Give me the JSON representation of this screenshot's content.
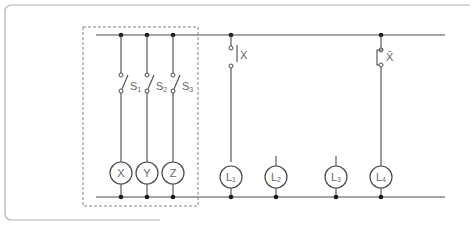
{
  "diagram": {
    "type": "relay-ladder-circuit",
    "colors": {
      "wire": "#4a4a4a",
      "node": "#1a1a1a",
      "label": "#666666",
      "frame": "#b0b0b0",
      "dashed_box": "#777777"
    },
    "dashed_group": {
      "description": "relay control section"
    },
    "switches": [
      {
        "id": "S1",
        "label": "S",
        "sub": "1",
        "type": "normally-open switch"
      },
      {
        "id": "S2",
        "label": "S",
        "sub": "2",
        "type": "normally-open switch"
      },
      {
        "id": "S3",
        "label": "S",
        "sub": "3",
        "type": "normally-open switch"
      }
    ],
    "relay_coils": [
      {
        "id": "X",
        "label": "X"
      },
      {
        "id": "Y",
        "label": "Y"
      },
      {
        "id": "Z",
        "label": "Z"
      }
    ],
    "contacts": [
      {
        "id": "X-NO",
        "label": "X",
        "type": "normally-open contact",
        "drives": "L1"
      },
      {
        "id": "X-NC",
        "label": "X̄",
        "type": "normally-closed contact",
        "drives": "L4"
      }
    ],
    "lamps": [
      {
        "id": "L1",
        "label": "L",
        "sub": "1",
        "connected": true
      },
      {
        "id": "L2",
        "label": "L",
        "sub": "2",
        "connected": false
      },
      {
        "id": "L3",
        "label": "L",
        "sub": "3",
        "connected": false
      },
      {
        "id": "L4",
        "label": "L",
        "sub": "4",
        "connected": true
      }
    ]
  }
}
